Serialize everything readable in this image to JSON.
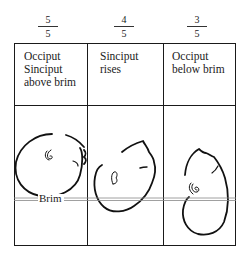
{
  "diagram": {
    "columns": [
      {
        "fraction": {
          "numerator": "5",
          "denominator": "5"
        },
        "label_lines": [
          "Occiput",
          "Sinciput",
          "above brim"
        ]
      },
      {
        "fraction": {
          "numerator": "4",
          "denominator": "5"
        },
        "label_lines": [
          "Sinciput",
          "rises"
        ]
      },
      {
        "fraction": {
          "numerator": "3",
          "denominator": "5"
        },
        "label_lines": [
          "Occiput",
          "below brim"
        ]
      }
    ],
    "brim_label": "Brim",
    "colors": {
      "ink": "#1a1a1a",
      "background": "#ffffff"
    }
  }
}
